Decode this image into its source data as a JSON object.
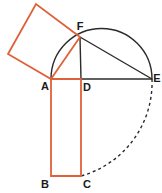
{
  "figure": {
    "canvas": {
      "width": 162,
      "height": 193,
      "background": "#ffffff"
    },
    "colors": {
      "orange": "#e0603a",
      "black": "#2b2b2b",
      "label": "#1a1a1a",
      "background": "#ffffff"
    },
    "points": {
      "A": {
        "x": 51,
        "y": 79,
        "label": "A",
        "label_x": 45,
        "label_y": 87
      },
      "B": {
        "x": 51,
        "y": 176,
        "label": "B",
        "label_x": 45,
        "label_y": 185
      },
      "C": {
        "x": 81,
        "y": 176,
        "label": "C",
        "label_x": 87,
        "label_y": 185
      },
      "D": {
        "x": 81,
        "y": 79,
        "label": "D",
        "label_x": 87,
        "label_y": 88
      },
      "E": {
        "x": 152,
        "y": 79,
        "label": "E",
        "label_x": 157,
        "label_y": 79
      },
      "F": {
        "x": 80,
        "y": 37,
        "label": "F",
        "label_x": 80,
        "label_y": 27
      },
      "S1": {
        "x": 8,
        "y": 54,
        "label": "",
        "label_x": 0,
        "label_y": 0
      },
      "S2": {
        "x": 36,
        "y": 4,
        "label": "",
        "label_x": 0,
        "label_y": 0
      }
    },
    "semicircle": {
      "center_x": 101.5,
      "center_y": 79,
      "radius": 50.5,
      "stroke": "#2b2b2b",
      "stroke_width": 1.4,
      "path": "M 51 79 A 50.5 50.5 0 0 1 152 79"
    },
    "segments": [
      {
        "name": "segment-AE",
        "from": "A",
        "to": "E",
        "stroke": "#2b2b2b",
        "stroke_width": 1.4,
        "dashed": false
      },
      {
        "name": "segment-FD",
        "from": "F",
        "to": "D",
        "stroke": "#2b2b2b",
        "stroke_width": 1.4,
        "dashed": false
      },
      {
        "name": "segment-FE",
        "from": "F",
        "to": "E",
        "stroke": "#2b2b2b",
        "stroke_width": 1.4,
        "dashed": false
      },
      {
        "name": "segment-BC",
        "from": "B",
        "to": "C",
        "stroke": "#2b2b2b",
        "stroke_width": 1.4,
        "dashed": true
      }
    ],
    "square_AFS2S1": {
      "name": "square-on-AF",
      "points": "51,79 80,37 36,4 8,54",
      "stroke": "#e0603a",
      "stroke_width": 1.8,
      "fill": "none"
    },
    "rectangle_ADCB": {
      "name": "rectangle-ADCB",
      "points": "51,79 81,79 81,176 51,176",
      "stroke": "#e0603a",
      "stroke_width": 1.8,
      "fill": "none"
    },
    "arc_EC": {
      "name": "dashed-arc-E-to-C",
      "stroke": "#2b2b2b",
      "stroke_width": 1.4,
      "dash_pattern": "3,3",
      "path": "M 152 79 A 97 97 0 0 1 81 176"
    },
    "labels": [
      "A",
      "B",
      "C",
      "D",
      "E",
      "F"
    ]
  }
}
